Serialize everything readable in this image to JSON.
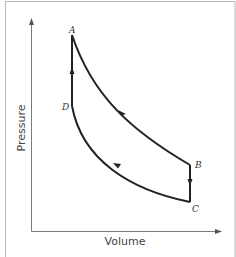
{
  "diagram": {
    "type": "pressure-volume cycle diagram",
    "axes": {
      "x_label": "Volume",
      "y_label": "Pressure"
    },
    "points": {
      "A": {
        "label": "A"
      },
      "B": {
        "label": "B"
      },
      "C": {
        "label": "C"
      },
      "D": {
        "label": "D"
      }
    },
    "segments": [
      {
        "from": "A",
        "to": "B",
        "shape": "curve",
        "direction": "A to B"
      },
      {
        "from": "B",
        "to": "C",
        "shape": "vertical line",
        "direction": "B to C (down)"
      },
      {
        "from": "C",
        "to": "D",
        "shape": "curve",
        "direction": "C to D"
      },
      {
        "from": "D",
        "to": "A",
        "shape": "vertical line",
        "direction": "D to A (up)"
      }
    ],
    "colors": {
      "curve": "#222222",
      "axis": "#7a7a7a",
      "frame": "#b8b8b8",
      "background": "#ffffff"
    }
  }
}
